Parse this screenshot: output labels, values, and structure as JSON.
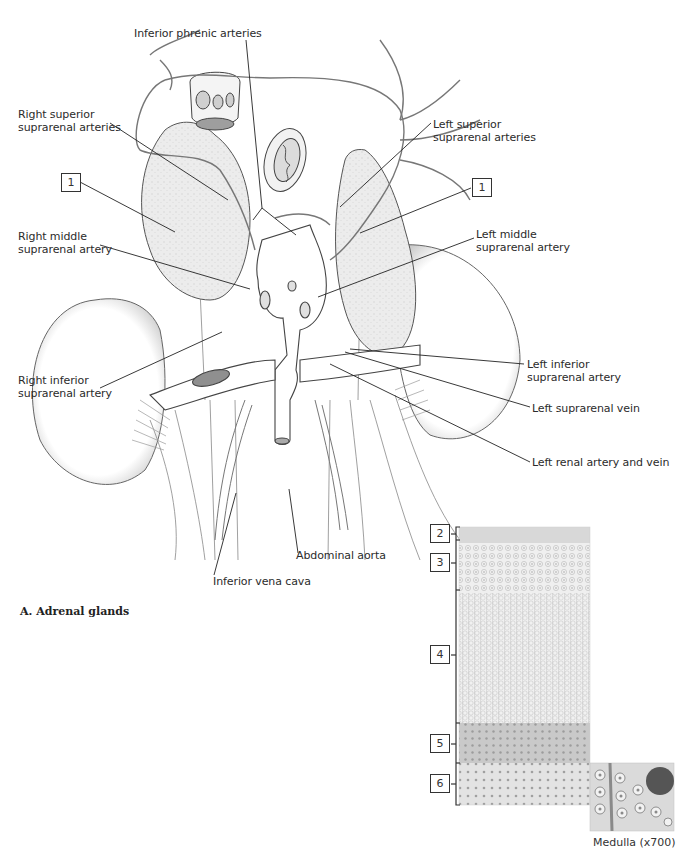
{
  "figure": {
    "caption": "A. Adrenal glands",
    "colors": {
      "background": "#ffffff",
      "line": "#2b2b2b",
      "tissue": "#e9e9e9",
      "shadow": "#bdbdbd"
    }
  },
  "labels": {
    "inferior_phrenic_arteries": "Inferior phrenic arteries",
    "right_superior_suprarenal_arteries": "Right superior\nsuprarenal arteries",
    "left_superior_suprarenal_arteries": "Left superior\nsuprarenal arteries",
    "right_middle_suprarenal_artery": "Right middle\nsuprarenal artery",
    "left_middle_suprarenal_artery": "Left middle\nsuprarenal artery",
    "right_inferior_suprarenal_artery": "Right inferior\nsuprarenal artery",
    "left_inferior_suprarenal_artery": "Left inferior\nsuprarenal artery",
    "left_suprarenal_vein": "Left suprarenal vein",
    "left_renal_artery_and_vein": "Left renal artery and vein",
    "abdominal_aorta": "Abdominal aorta",
    "inferior_vena_cava": "Inferior vena cava"
  },
  "number_boxes": {
    "right_gland": "1",
    "left_gland": "1",
    "layer_2": "2",
    "layer_3": "3",
    "layer_4": "4",
    "layer_5": "5",
    "layer_6": "6"
  },
  "histology": {
    "inset_caption": "Medulla (x700)"
  }
}
